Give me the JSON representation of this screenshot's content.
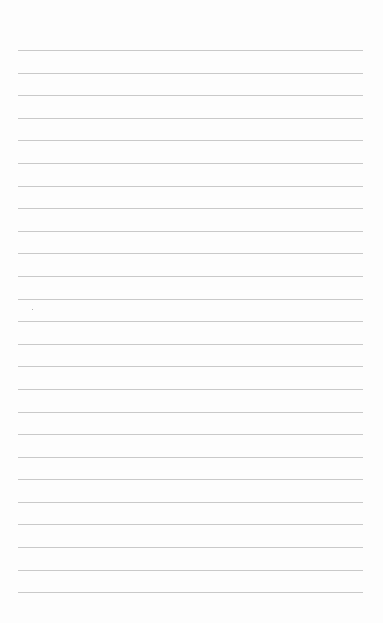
{
  "page": {
    "type": "blank lined paper",
    "line_count": 25,
    "background_color": "#fdfdfd",
    "line_color": "#c9c9c9",
    "text": []
  }
}
